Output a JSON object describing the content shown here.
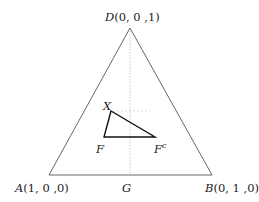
{
  "diagram": {
    "type": "ternary simplex",
    "vertices": {
      "D": {
        "name": "D",
        "coords": "(0, 0 ,1)"
      },
      "A": {
        "name": "A",
        "coords": "(1, 0 ,0)"
      },
      "B": {
        "name": "B",
        "coords": "(0, 1 ,0)"
      }
    },
    "midpoint": {
      "name": "G"
    },
    "inner_triangle": {
      "X": "X",
      "F": "F",
      "Fc_base": "F",
      "Fc_sup": "c"
    },
    "colors": {
      "outer_triangle": "#555555",
      "inner_triangle": "#111111",
      "dotted_line": "#bbbbbb",
      "text": "#222222"
    }
  }
}
